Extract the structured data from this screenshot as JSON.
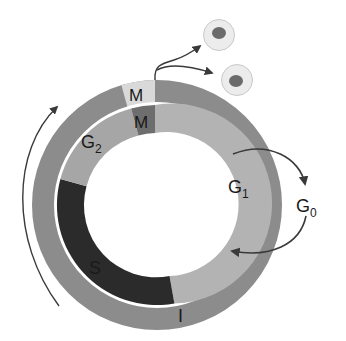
{
  "diagram": {
    "type": "cell-cycle",
    "colors": {
      "outer_ring": "#8c8c8c",
      "outer_m": "#d9d9d9",
      "inner_g1": "#b3b3b3",
      "inner_g2": "#a6a6a6",
      "inner_s": "#2b2b2b",
      "inner_m": "#6e6e6e",
      "arrow": "#3a3a3a",
      "cell_body": "#ececec",
      "cell_nucleus": "#6b6b6b"
    },
    "outer_ring": {
      "segments": [
        {
          "label": "M"
        },
        {
          "label": "I"
        }
      ]
    },
    "inner_ring": {
      "segments": [
        {
          "label": "M"
        },
        {
          "label": "G",
          "sub": "1"
        },
        {
          "label": "S"
        },
        {
          "label": "G",
          "sub": "2"
        }
      ]
    },
    "exit_phase": {
      "label": "G",
      "sub": "0"
    },
    "daughter_cells": 2
  }
}
